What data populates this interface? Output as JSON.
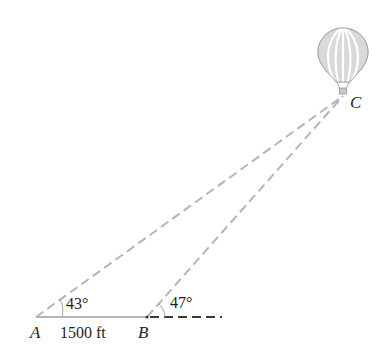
{
  "diagram": {
    "points": {
      "A": {
        "label": "A"
      },
      "B": {
        "label": "B"
      },
      "C": {
        "label": "C"
      }
    },
    "angles": {
      "at_A": "43°",
      "at_B": "47°"
    },
    "distance_AB": "1500 ft",
    "object_at_C": "hot-air-balloon",
    "colors": {
      "line": "#b5b5b5",
      "ground_dash": "#3a3a3a",
      "text": "#231f20"
    }
  }
}
